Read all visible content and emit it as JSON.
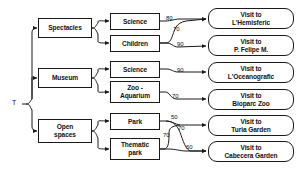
{
  "diagram": {
    "root": {
      "label": "T"
    },
    "level1": [
      {
        "id": "spectacles",
        "label": "Spectacles",
        "x": 38,
        "y": 18,
        "w": 54,
        "h": 20
      },
      {
        "id": "museum",
        "label": "Museum",
        "x": 38,
        "y": 68,
        "w": 54,
        "h": 20
      },
      {
        "id": "open-spaces",
        "label": "Open\nspaces",
        "x": 38,
        "y": 119,
        "w": 54,
        "h": 24
      }
    ],
    "level2": [
      {
        "id": "science-1",
        "label": "Science",
        "x": 110,
        "y": 13,
        "w": 50,
        "h": 17
      },
      {
        "id": "children",
        "label": "Children",
        "x": 110,
        "y": 35,
        "w": 50,
        "h": 17
      },
      {
        "id": "science-2",
        "label": "Science",
        "x": 110,
        "y": 61,
        "w": 50,
        "h": 17
      },
      {
        "id": "zoo-aquarium",
        "label": "Zoo -\nAquarium",
        "x": 110,
        "y": 81,
        "w": 50,
        "h": 22
      },
      {
        "id": "park",
        "label": "Park",
        "x": 110,
        "y": 113,
        "w": 50,
        "h": 17
      },
      {
        "id": "thematic-park",
        "label": "Thematic\npark",
        "x": 110,
        "y": 138,
        "w": 50,
        "h": 22
      }
    ],
    "leaves": [
      {
        "id": "hemisferic",
        "label": "Visit to\nL'Hemisferic",
        "x": 208,
        "y": 8,
        "w": 86,
        "h": 21
      },
      {
        "id": "felipe",
        "label": "Visit to\nP. Felipe M.",
        "x": 208,
        "y": 35,
        "w": 86,
        "h": 21
      },
      {
        "id": "oceanografic",
        "label": "Visit to\nL'Oceanografic",
        "x": 208,
        "y": 62,
        "w": 86,
        "h": 21
      },
      {
        "id": "bioparc",
        "label": "Visit to\nBioparc Zoo",
        "x": 208,
        "y": 89,
        "w": 86,
        "h": 21
      },
      {
        "id": "turia",
        "label": "Visit to\nTuria Garden",
        "x": 208,
        "y": 115,
        "w": 86,
        "h": 21
      },
      {
        "id": "cabecera",
        "label": "Visit to\nCabecera Garden",
        "x": 208,
        "y": 141,
        "w": 86,
        "h": 21
      }
    ],
    "edge_labels": [
      {
        "id": "w-science1-hemisferic",
        "value": "80",
        "x": 166,
        "y": 15
      },
      {
        "id": "w-children-hemisferic",
        "value": "70",
        "x": 173,
        "y": 26
      },
      {
        "id": "w-children-felipe",
        "value": "90",
        "x": 177,
        "y": 41
      },
      {
        "id": "w-science2-oceanografic",
        "value": "90",
        "x": 177,
        "y": 67
      },
      {
        "id": "w-zoo-bioparc",
        "value": "70",
        "x": 172,
        "y": 93
      },
      {
        "id": "w-park-turia",
        "value": "50",
        "x": 171,
        "y": 114
      },
      {
        "id": "w-park-cabecera",
        "value": "70",
        "x": 178,
        "y": 125
      },
      {
        "id": "w-thematic-turia",
        "value": "70",
        "x": 163,
        "y": 132
      },
      {
        "id": "w-thematic-cabecera",
        "value": "60",
        "x": 186,
        "y": 144
      }
    ],
    "colors": {
      "stroke": "#1a1a1a",
      "background": "#ffffff",
      "text": "#111111"
    }
  }
}
